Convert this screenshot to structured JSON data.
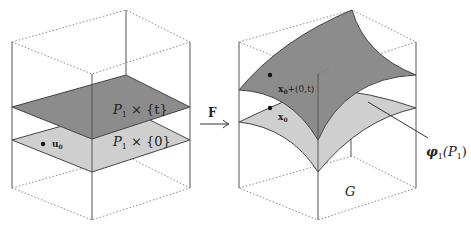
{
  "figure": {
    "left_panel": {
      "upper_plane_label": "P",
      "upper_plane_label_sub": "1",
      "upper_plane_label_rest": " × {t}",
      "lower_plane_label": "P",
      "lower_plane_label_sub": "1",
      "lower_plane_label_rest": " × {0}",
      "point_label": "u",
      "point_label_sub": "0"
    },
    "arrow": {
      "label": "F"
    },
    "right_panel": {
      "upper_point_label": "x",
      "upper_point_label_sub": "0",
      "upper_point_label_rest": "+(0,t)",
      "lower_point_label": "x",
      "lower_point_label_sub": "0",
      "surface_label": "φ",
      "surface_label_sub": "1",
      "surface_label_rest": "(P",
      "surface_label_sub2": "1",
      "surface_label_close": ")",
      "base_label": "G"
    },
    "colors": {
      "dark_surface": "#8c8c8c",
      "light_surface": "#cfcfcf",
      "line": "#444444",
      "dotted": "#888888"
    }
  }
}
